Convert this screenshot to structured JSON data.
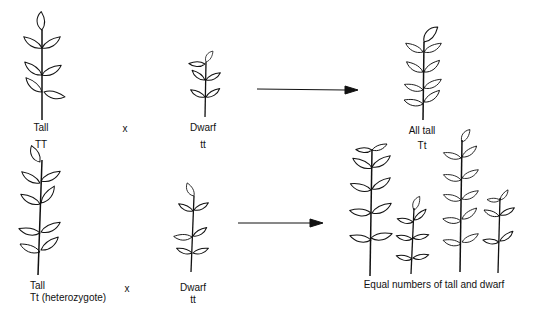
{
  "diagram": {
    "cross1": {
      "parent1": {
        "phenotype": "Tall",
        "genotype": "TT"
      },
      "cross_symbol": "x",
      "parent2": {
        "phenotype": "Dwarf",
        "genotype": "tt"
      },
      "offspring": {
        "phenotype": "All tall",
        "genotype": "Tt"
      }
    },
    "cross2": {
      "parent1": {
        "phenotype": "Tall",
        "genotype": "Tt (heterozygote)"
      },
      "cross_symbol": "x",
      "parent2": {
        "phenotype": "Dwarf",
        "genotype": "tt"
      },
      "offspring": {
        "description": "Equal numbers of tall and dwarf"
      }
    },
    "colors": {
      "ink": "#111111",
      "background": "#ffffff"
    }
  }
}
